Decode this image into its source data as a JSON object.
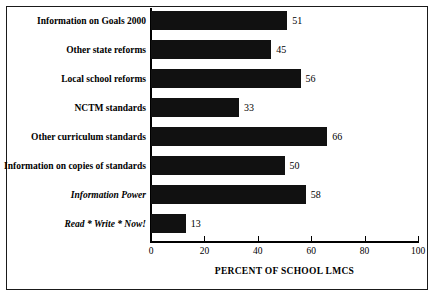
{
  "chart_data": {
    "type": "bar",
    "orientation": "horizontal",
    "title": "",
    "xlabel": "PERCENT OF SCHOOL LMCS",
    "ylabel": "",
    "xlim": [
      0,
      100
    ],
    "xticks": [
      0,
      20,
      40,
      60,
      80,
      100
    ],
    "xtick_labels": [
      "0",
      "20",
      "40",
      "60",
      "80",
      "100"
    ],
    "grid": false,
    "legend": false,
    "bar_color": "#111111",
    "categories": [
      "Information on Goals 2000",
      "Other state reforms",
      "Local school reforms",
      "NCTM standards",
      "Other curriculum standards",
      "Information on copies of standards",
      "Information Power",
      "Read * Write * Now!"
    ],
    "category_styles": [
      "bold",
      "bold",
      "bold",
      "bold",
      "bold",
      "bold",
      "bold-italic",
      "bold-italic"
    ],
    "values": [
      51,
      45,
      56,
      33,
      66,
      50,
      58,
      13
    ],
    "value_labels": [
      "51",
      "45",
      "56",
      "33",
      "66",
      "50",
      "58",
      "13"
    ]
  }
}
